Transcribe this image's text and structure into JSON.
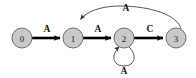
{
  "figure": {
    "background_color": "#ffffff"
  },
  "style": {
    "node_fill": "#c9c9c9",
    "node_stroke": "#6e6e6e",
    "edge_color": "#000000",
    "curve_color": "#555555",
    "label_color": "#111111"
  },
  "graph": {
    "nodes": [
      {
        "id": "0",
        "label": "0",
        "cx": 22,
        "cy": 38,
        "r": 10
      },
      {
        "id": "1",
        "label": "1",
        "cx": 73,
        "cy": 38,
        "r": 10
      },
      {
        "id": "2",
        "label": "2",
        "cx": 124,
        "cy": 38,
        "r": 10
      },
      {
        "id": "3",
        "label": "3",
        "cx": 176,
        "cy": 38,
        "r": 10
      }
    ],
    "edges": [
      {
        "id": "e0",
        "from": "0",
        "to": "1",
        "label": "A",
        "kind": "straight",
        "label_x": 47,
        "label_y": 29
      },
      {
        "id": "e1",
        "from": "1",
        "to": "2",
        "label": "A",
        "kind": "straight",
        "label_x": 98,
        "label_y": 29
      },
      {
        "id": "e2",
        "from": "2",
        "to": "3",
        "label": "C",
        "kind": "straight",
        "label_x": 150,
        "label_y": 29
      },
      {
        "id": "e3",
        "from": "3",
        "to": "1",
        "label": "A",
        "kind": "curve-top",
        "label_x": 126,
        "label_y": 8
      },
      {
        "id": "e4",
        "from": "2",
        "to": "2",
        "label": "A",
        "kind": "self-loop-bottom",
        "label_x": 124,
        "label_y": 70
      }
    ]
  }
}
